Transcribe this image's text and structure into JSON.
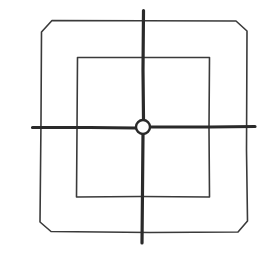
{
  "diagram": {
    "title": "",
    "colors": {
      "background": "#ffffff",
      "stroke": "#2a2a2a"
    },
    "elements": {
      "outer_square": {
        "x1": 40,
        "y1": 20,
        "x2": 248,
        "y2": 233,
        "chamfer": 10
      },
      "inner_square": {
        "x1": 77,
        "y1": 57,
        "x2": 210,
        "y2": 197
      },
      "vertical_axis": {
        "x": 143,
        "y1": 10,
        "y2": 243
      },
      "horizontal_axis": {
        "y": 127,
        "x1": 32,
        "x2": 255
      },
      "center_circle": {
        "cx": 143,
        "cy": 127,
        "r": 7
      }
    }
  }
}
